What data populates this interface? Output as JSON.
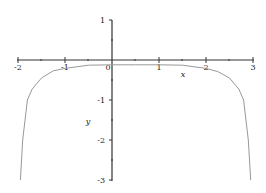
{
  "chart_data": {
    "type": "line",
    "title": "",
    "xlabel": "x",
    "ylabel": "y",
    "xlim": [
      -2,
      3
    ],
    "ylim": [
      -3,
      1
    ],
    "grid": false,
    "legend": null,
    "x_ticks": [
      "-2",
      "-1",
      "0",
      "1",
      "2",
      "3"
    ],
    "y_ticks": [
      "1",
      "-1",
      "-2",
      "-3"
    ],
    "series": [
      {
        "name": "f(x)",
        "color": "#999999",
        "x": [
          -1.95,
          -1.9,
          -1.8,
          -1.7,
          -1.5,
          -1.25,
          -1.0,
          -0.5,
          0.0,
          0.5,
          1.0,
          1.5,
          2.0,
          2.25,
          2.5,
          2.7,
          2.8,
          2.9,
          2.95
        ],
        "y": [
          -3.0,
          -2.0,
          -1.0,
          -0.73,
          -0.45,
          -0.27,
          -0.21,
          -0.13,
          -0.12,
          -0.12,
          -0.12,
          -0.13,
          -0.21,
          -0.29,
          -0.45,
          -0.73,
          -1.0,
          -2.0,
          -3.0
        ]
      }
    ]
  },
  "labels": {
    "x_axis": "x",
    "y_axis": "y",
    "origin": "0",
    "xt_m2": "-2",
    "xt_m1": "-1",
    "xt_1": "1",
    "xt_2": "2",
    "xt_3": "3",
    "yt_1": "1",
    "yt_m1": "-1",
    "yt_m2": "-2",
    "yt_m3": "-3"
  }
}
